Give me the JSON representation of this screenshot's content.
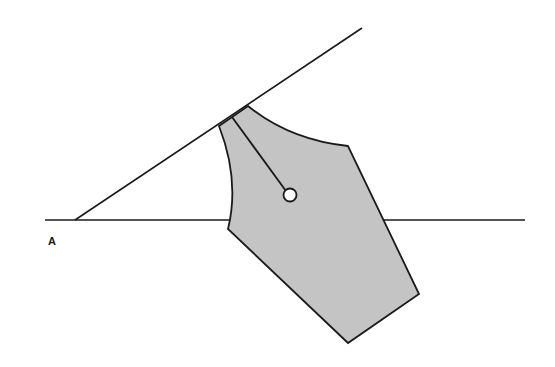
{
  "diagram": {
    "label": "A",
    "colors": {
      "line": "#1a1a1a",
      "nib_fill": "#c4c4c4",
      "hole_fill": "#ffffff"
    },
    "elements": [
      "horizontal baseline",
      "diagonal line at ~34 degrees meeting baseline",
      "pen nib shape resting on diagonal line",
      "nib slit ending in breather hole"
    ]
  }
}
